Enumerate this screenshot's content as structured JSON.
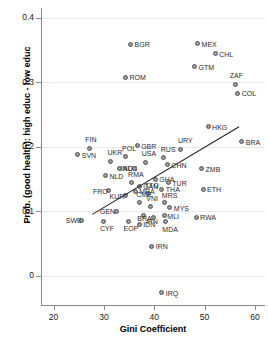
{
  "chart_data": {
    "type": "scatter",
    "title": "",
    "xlabel": "Gini Coefficient",
    "ylabel": "Prob. (good health): high educ - low educ",
    "xlim": [
      17.5,
      62
    ],
    "ylim": [
      -0.045,
      0.415
    ],
    "xticks": [
      20,
      30,
      40,
      50,
      60
    ],
    "yticks": [
      "0",
      "0.1",
      "0.2",
      "0.3",
      "0.4"
    ],
    "ytick_values": [
      0,
      0.1,
      0.2,
      0.3,
      0.4
    ],
    "grid": "horizontal",
    "legend": "none",
    "marker": "filled-grey-circle",
    "trendline": {
      "type": "linear-fit",
      "x_start": 27.6,
      "y_start": 0.0955,
      "x_end": 56.8,
      "y_end": 0.2315,
      "color": "#1f1f1f"
    },
    "points": [
      {
        "label": "BGR",
        "x": 35.3,
        "y": 0.359,
        "lx": 4,
        "ly": -3
      },
      {
        "label": "MEX",
        "x": 48.6,
        "y": 0.36,
        "lx": 4,
        "ly": -3
      },
      {
        "label": "CHL",
        "x": 52.1,
        "y": 0.344,
        "lx": 4,
        "ly": -3
      },
      {
        "label": "GTM",
        "x": 48.0,
        "y": 0.324,
        "lx": 4,
        "ly": -3
      },
      {
        "label": "ROM",
        "x": 34.3,
        "y": 0.308,
        "lx": 4,
        "ly": -3
      },
      {
        "label": "ZAF",
        "x": 56.2,
        "y": 0.297,
        "lx": -6,
        "ly": -12
      },
      {
        "label": "COL",
        "x": 56.6,
        "y": 0.283,
        "lx": 4,
        "ly": -3
      },
      {
        "label": "HKG",
        "x": 50.7,
        "y": 0.231,
        "lx": 4,
        "ly": -3
      },
      {
        "label": "BRA",
        "x": 57.4,
        "y": 0.208,
        "lx": 4,
        "ly": -3
      },
      {
        "label": "GBR",
        "x": 36.6,
        "y": 0.202,
        "lx": 4,
        "ly": -3
      },
      {
        "label": "FIN",
        "x": 27.1,
        "y": 0.198,
        "lx": -4,
        "ly": -12
      },
      {
        "label": "URY",
        "x": 45.3,
        "y": 0.196,
        "lx": -3,
        "ly": -12
      },
      {
        "label": "SVN",
        "x": 24.8,
        "y": 0.188,
        "lx": 4,
        "ly": -3
      },
      {
        "label": "POL",
        "x": 34.2,
        "y": 0.185,
        "lx": -3,
        "ly": -12
      },
      {
        "label": "RUS",
        "x": 41.9,
        "y": 0.183,
        "lx": -3,
        "ly": -12
      },
      {
        "label": "UKR",
        "x": 31.3,
        "y": 0.178,
        "lx": -3,
        "ly": -12
      },
      {
        "label": "USA",
        "x": 38.3,
        "y": 0.176,
        "lx": -4,
        "ly": -12
      },
      {
        "label": "CHN",
        "x": 42.6,
        "y": 0.172,
        "lx": 4,
        "ly": -3
      },
      {
        "label": "AUS",
        "x": 33.0,
        "y": 0.167,
        "lx": 4,
        "ly": -3
      },
      {
        "label": "IND",
        "x": 36.1,
        "y": 0.167,
        "lx": -14,
        "ly": -3
      },
      {
        "label": "ZMB",
        "x": 49.4,
        "y": 0.166,
        "lx": 4,
        "ly": -3
      },
      {
        "label": "NLD",
        "x": 30.3,
        "y": 0.155,
        "lx": 4,
        "ly": -3
      },
      {
        "label": "GHA",
        "x": 40.2,
        "y": 0.15,
        "lx": 4,
        "ly": -3
      },
      {
        "label": "TUR",
        "x": 42.8,
        "y": 0.144,
        "lx": 4,
        "ly": -3
      },
      {
        "label": "RMA",
        "x": 35.4,
        "y": 0.145,
        "lx": -3,
        "ly": -11
      },
      {
        "label": "GAN",
        "x": 37.0,
        "y": 0.139,
        "lx": 4,
        "ly": -3
      },
      {
        "label": "ETH",
        "x": 49.7,
        "y": 0.134,
        "lx": 4,
        "ly": -3
      },
      {
        "label": "THA",
        "x": 41.5,
        "y": 0.134,
        "lx": 4,
        "ly": -3
      },
      {
        "label": "FRO",
        "x": 31.0,
        "y": 0.132,
        "lx": -16,
        "ly": -3
      },
      {
        "label": "MRA",
        "x": 36.2,
        "y": 0.131,
        "lx": 4,
        "ly": -3
      },
      {
        "label": "TTO",
        "x": 38.9,
        "y": 0.128,
        "lx": -4,
        "ly": -11
      },
      {
        "label": "KUR",
        "x": 34.3,
        "y": 0.124,
        "lx": -16,
        "ly": -3
      },
      {
        "label": "CME",
        "x": 37.0,
        "y": 0.114,
        "lx": -3,
        "ly": -11
      },
      {
        "label": "MRS",
        "x": 42.1,
        "y": 0.113,
        "lx": -3,
        "ly": -11
      },
      {
        "label": "VNI",
        "x": 39.2,
        "y": 0.108,
        "lx": -4,
        "ly": -11
      },
      {
        "label": "MYS",
        "x": 43.1,
        "y": 0.106,
        "lx": 4,
        "ly": -3
      },
      {
        "label": "GEN",
        "x": 32.4,
        "y": 0.1,
        "lx": -16,
        "ly": -3
      },
      {
        "label": "IPN",
        "x": 37.8,
        "y": 0.094,
        "lx": 3,
        "ly": 3
      },
      {
        "label": "MLI",
        "x": 42.0,
        "y": 0.093,
        "lx": 3,
        "ly": -3
      },
      {
        "label": "RWA",
        "x": 48.3,
        "y": 0.091,
        "lx": 4,
        "ly": -3
      },
      {
        "label": "BRA",
        "x": 39.8,
        "y": 0.09,
        "lx": -16,
        "ly": -3
      },
      {
        "label": "SWE",
        "x": 25.6,
        "y": 0.086,
        "lx": -16,
        "ly": -3
      },
      {
        "label": "CYF",
        "x": 30.0,
        "y": 0.085,
        "lx": -4,
        "ly": 4
      },
      {
        "label": "EOP",
        "x": 34.9,
        "y": 0.085,
        "lx": -5,
        "ly": 4
      },
      {
        "label": "MDA",
        "x": 42.2,
        "y": 0.084,
        "lx": -3,
        "ly": 4
      },
      {
        "label": "IDN",
        "x": 37.0,
        "y": 0.08,
        "lx": 4,
        "ly": -3
      },
      {
        "label": "IRN",
        "x": 39.5,
        "y": 0.046,
        "lx": 4,
        "ly": -3
      },
      {
        "label": "IRQ",
        "x": 41.5,
        "y": -0.026,
        "lx": 4,
        "ly": -3
      }
    ]
  }
}
